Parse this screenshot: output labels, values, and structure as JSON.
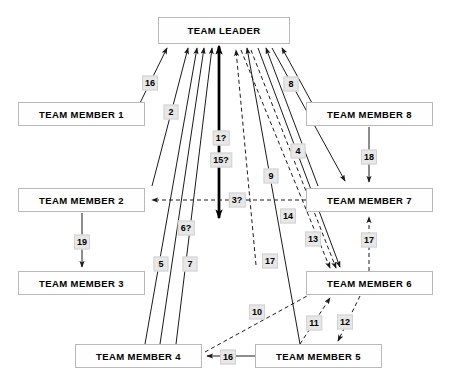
{
  "diagram": {
    "background_color": "#ffffff",
    "node_fill": "#fefefe",
    "node_border": "#b9b9b9",
    "label_fill": "#e7e7e7",
    "label_border": "#d2d2d2",
    "line_color": "#1a1a1a",
    "nodes": [
      {
        "id": "leader",
        "label": "TEAM LEADER",
        "x": 158,
        "y": 17,
        "w": 132,
        "h": 27
      },
      {
        "id": "m1",
        "label": "TEAM MEMBER 1",
        "x": 18,
        "y": 102,
        "w": 127,
        "h": 24
      },
      {
        "id": "m8",
        "label": "TEAM MEMBER 8",
        "x": 306,
        "y": 102,
        "w": 127,
        "h": 24
      },
      {
        "id": "m2",
        "label": "TEAM MEMBER 2",
        "x": 18,
        "y": 188,
        "w": 127,
        "h": 24
      },
      {
        "id": "m7",
        "label": "TEAM MEMBER 7",
        "x": 306,
        "y": 188,
        "w": 127,
        "h": 24
      },
      {
        "id": "m3",
        "label": "TEAM MEMBER 3",
        "x": 18,
        "y": 271,
        "w": 127,
        "h": 24
      },
      {
        "id": "m6",
        "label": "TEAM MEMBER 6",
        "x": 306,
        "y": 271,
        "w": 127,
        "h": 24
      },
      {
        "id": "m4",
        "label": "TEAM MEMBER 4",
        "x": 75,
        "y": 344,
        "w": 127,
        "h": 24
      },
      {
        "id": "m5",
        "label": "TEAM MEMBER 5",
        "x": 255,
        "y": 344,
        "w": 127,
        "h": 24
      }
    ],
    "edge_labels": [
      {
        "text": "16",
        "x": 150,
        "y": 83,
        "edge": "m1-to-leader"
      },
      {
        "text": "2",
        "x": 171,
        "y": 112,
        "edge": "m2-to-leader"
      },
      {
        "text": "8",
        "x": 291,
        "y": 84,
        "edge": "m8-to-leader"
      },
      {
        "text": "1?",
        "x": 221,
        "y": 138,
        "edge": "leader-m2-thick-a"
      },
      {
        "text": "15?",
        "x": 221,
        "y": 160,
        "edge": "leader-m2-thick-b"
      },
      {
        "text": "4",
        "x": 298,
        "y": 151,
        "edge": "m7-to-leader"
      },
      {
        "text": "9",
        "x": 271,
        "y": 176,
        "edge": "m6-to-leader-dashed"
      },
      {
        "text": "3?",
        "x": 237,
        "y": 200,
        "edge": "m7-to-m2-dashed"
      },
      {
        "text": "14",
        "x": 288,
        "y": 216,
        "edge": "leader-to-m6-dashed-a"
      },
      {
        "text": "13",
        "x": 313,
        "y": 239,
        "edge": "leader-to-m6-b"
      },
      {
        "text": "6?",
        "x": 186,
        "y": 228,
        "edge": "m4-to-leader-c"
      },
      {
        "text": "19",
        "x": 82,
        "y": 242,
        "edge": "m2-to-m3"
      },
      {
        "text": "18",
        "x": 369,
        "y": 157,
        "edge": "m8-to-m7"
      },
      {
        "text": "17",
        "x": 369,
        "y": 240,
        "edge": "m6-to-m7-dashed"
      },
      {
        "text": "5",
        "x": 161,
        "y": 264,
        "edge": "leader-to-m4-a"
      },
      {
        "text": "7",
        "x": 190,
        "y": 264,
        "edge": "m4-to-leader-b"
      },
      {
        "text": "17",
        "x": 270,
        "y": 261,
        "edge": "m5-to-leader"
      },
      {
        "text": "10",
        "x": 257,
        "y": 312,
        "edge": "m4-to-m6-dashed"
      },
      {
        "text": "11",
        "x": 314,
        "y": 323,
        "edge": "m5-to-m6-dashed"
      },
      {
        "text": "12",
        "x": 345,
        "y": 322,
        "edge": "m6-to-m5-dashed"
      },
      {
        "text": "16",
        "x": 228,
        "y": 357,
        "edge": "m5-to-m4"
      }
    ]
  }
}
